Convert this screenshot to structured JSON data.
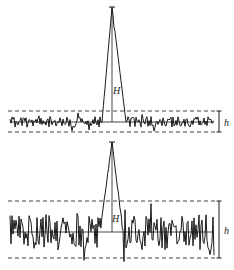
{
  "panels": [
    {
      "id": "high-snr",
      "description": "Strong peak over low noise",
      "peak_label": "H",
      "noise_label": "h",
      "noise_amplitude": 0.35,
      "seed": 7
    },
    {
      "id": "low-snr",
      "description": "Weak peak over high noise",
      "peak_label": "H",
      "noise_label": "h",
      "noise_amplitude": 1.0,
      "seed": 19
    }
  ],
  "colors": {
    "line": "#1a1a1a",
    "dash": "#444444",
    "background": "#ffffff"
  }
}
